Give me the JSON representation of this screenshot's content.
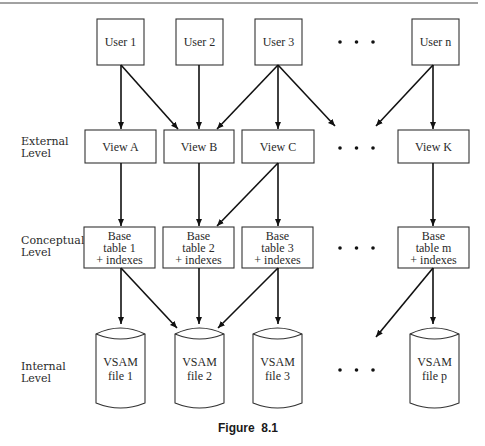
{
  "diagram": {
    "levels": [
      {
        "name": "external",
        "line1": "External",
        "line2": "Level"
      },
      {
        "name": "conceptual",
        "line1": "Conceptual",
        "line2": "Level"
      },
      {
        "name": "internal",
        "line1": "Internal",
        "line2": "Level"
      }
    ],
    "users": [
      "User 1",
      "User 2",
      "User 3",
      "User n"
    ],
    "views": [
      "View A",
      "View B",
      "View C",
      "View K"
    ],
    "base_tables": [
      {
        "l1": "Base",
        "l2": "table 1",
        "l3": "+ indexes"
      },
      {
        "l1": "Base",
        "l2": "table 2",
        "l3": "+ indexes"
      },
      {
        "l1": "Base",
        "l2": "table 3",
        "l3": "+ indexes"
      },
      {
        "l1": "Base",
        "l2": "table m",
        "l3": "+ indexes"
      }
    ],
    "files": [
      {
        "l1": "VSAM",
        "l2": "file 1"
      },
      {
        "l1": "VSAM",
        "l2": "file 2"
      },
      {
        "l1": "VSAM",
        "l2": "file 3"
      },
      {
        "l1": "VSAM",
        "l2": "file p"
      }
    ],
    "ellipsis": "• • •",
    "caption": "Figure  8.1",
    "colors": {
      "line": "#111111",
      "box_stroke": "#333333",
      "background": "#ffffff"
    }
  }
}
